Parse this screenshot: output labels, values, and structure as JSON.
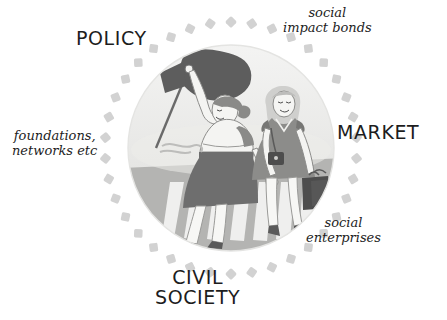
{
  "figure": {
    "title_visible": false,
    "type": "hand-drawn-conceptual-diagram",
    "background_color": "#ffffff"
  },
  "sectors": {
    "policy": {
      "label": "POLICY",
      "position": "top-left"
    },
    "market": {
      "label": "MARKET",
      "position": "right"
    },
    "civil_society": {
      "label": "CIVIL\nSOCIETY",
      "position": "bottom"
    }
  },
  "annotations": {
    "social_impact_bonds": {
      "label": "social\nimpact bonds",
      "position": "top-right"
    },
    "foundations_networks": {
      "label": "foundations,\nnetworks etc",
      "position": "left"
    },
    "social_enterprises": {
      "label": "social\nenterprises",
      "position": "bottom-right"
    }
  },
  "ring": {
    "style": "dashed",
    "dash_shape": "rounded-square",
    "dash_count": 38,
    "dash_color": "#d2d2d2",
    "center_x": 231,
    "center_y": 148,
    "radius": 126
  },
  "illustration": {
    "shape": "circle",
    "center_x": 231,
    "center_y": 148,
    "radius": 103,
    "sky_color": "#f0f0ef",
    "ground_color": "#b4b4b2",
    "scene_description": "two women walking hand in hand across a zebra crossing",
    "figures": [
      {
        "name": "activist-woman",
        "holds": "flag",
        "flag_color": "#5d5d5d",
        "skirt_color": "#6e6e6e",
        "top_color": "#f2f2f0"
      },
      {
        "name": "business-woman",
        "holds": "shopping bags",
        "bag_color": "#4d4d4d",
        "dress_color": "#8c8c8c",
        "hair_color": "#cfcfcd"
      }
    ],
    "crossing": {
      "name": "zebra-crossing",
      "stripe_color": "#efefee",
      "stripe_count": 7
    }
  },
  "colors": {
    "ink": "#1d1d1d",
    "dash_gray": "#d2d2d2",
    "dark_gray": "#4d4d4d",
    "mid_gray": "#8c8c8c",
    "light_gray": "#d8d8d6"
  }
}
